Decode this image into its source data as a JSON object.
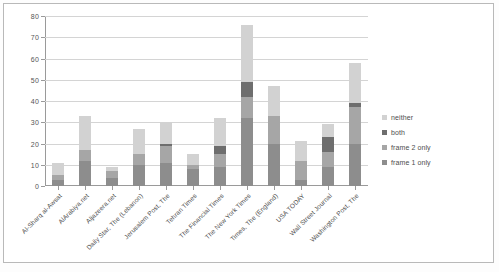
{
  "chart_data": {
    "type": "bar",
    "subtype": "stacked-column",
    "title": "",
    "xlabel": "",
    "ylabel": "",
    "ylim": [
      0,
      80
    ],
    "ytick_step": 10,
    "yticks": [
      "0",
      "10",
      "20",
      "30",
      "40",
      "50",
      "60",
      "70",
      "80"
    ],
    "grid": true,
    "legend_position": "right",
    "categories": [
      "Al-Sharq al-Awsat",
      "AlArabiya.net",
      "Aljazeera.net",
      "Daily Star, The (Lebanon)",
      "Jerusalem Post, The",
      "Tehran Times",
      "The Financial Times",
      "The New York Times",
      "Times, The (England)",
      "USA TODAY",
      "Wall Street Journal",
      "Washington Post, The"
    ],
    "series": [
      {
        "name": "frame 1 only",
        "color": "#8d8d8d",
        "values": [
          3,
          12,
          4,
          10,
          11,
          8,
          9,
          32,
          20,
          3,
          9,
          20
        ]
      },
      {
        "name": "frame 2 only",
        "color": "#a6a6a6",
        "values": [
          2,
          5,
          3,
          5,
          8,
          2,
          6,
          10,
          13,
          9,
          7,
          17
        ]
      },
      {
        "name": "both",
        "color": "#6e6e6e",
        "values": [
          0,
          0,
          0,
          0,
          1,
          0,
          4,
          7,
          0,
          0,
          7,
          2
        ]
      },
      {
        "name": "neither",
        "color": "#d2d2d2",
        "values": [
          6,
          16,
          2,
          12,
          10,
          5,
          13,
          27,
          14,
          9,
          6,
          19
        ]
      }
    ],
    "totals": [
      11,
      33,
      9,
      27,
      30,
      15,
      32,
      76,
      47,
      21,
      29,
      58
    ],
    "legend_order_top_to_bottom": [
      "neither",
      "both",
      "frame 2 only",
      "frame 1 only"
    ],
    "stack_order_bottom_to_top": [
      "frame 1 only",
      "frame 2 only",
      "both",
      "neither"
    ]
  },
  "colors": {
    "frame_1_only": "#8d8d8d",
    "frame_2_only": "#a6a6a6",
    "both": "#6e6e6e",
    "neither": "#d2d2d2",
    "gridline": "#d4d4d4",
    "axis": "#9a9a9a",
    "text": "#4d4d4d",
    "page_border": "#b9b9b9"
  }
}
